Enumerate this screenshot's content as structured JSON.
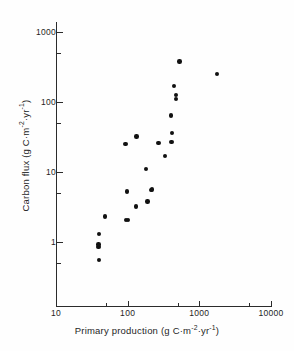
{
  "chart_data": {
    "type": "scatter",
    "title": "",
    "xlabel": "Primary production (g C·m⁻²·yr⁻¹)",
    "ylabel": "Carbon flux (g C·m⁻²·yr⁻¹)",
    "xscale": "log",
    "yscale": "log",
    "xlim": [
      10,
      10000
    ],
    "ylim": [
      0.1,
      1000
    ],
    "grid": false,
    "legend": null,
    "xticks": [
      10,
      100,
      1000,
      10000
    ],
    "xtick_labels": [
      "10",
      "100",
      "1000",
      "10000"
    ],
    "yticks": [
      1,
      10,
      100,
      1000
    ],
    "ytick_labels": [
      "1",
      "10",
      "100",
      "1000"
    ],
    "points": [
      {
        "x": 40,
        "y": 0.55
      },
      {
        "x": 39,
        "y": 0.85
      },
      {
        "x": 39,
        "y": 0.92
      },
      {
        "x": 40,
        "y": 1.3
      },
      {
        "x": 48,
        "y": 2.3
      },
      {
        "x": 95,
        "y": 2.05
      },
      {
        "x": 102,
        "y": 2.05
      },
      {
        "x": 130,
        "y": 3.2
      },
      {
        "x": 190,
        "y": 3.8
      },
      {
        "x": 97,
        "y": 5.3
      },
      {
        "x": 210,
        "y": 5.5
      },
      {
        "x": 218,
        "y": 5.6
      },
      {
        "x": 180,
        "y": 11
      },
      {
        "x": 330,
        "y": 17
      },
      {
        "x": 93,
        "y": 25
      },
      {
        "x": 270,
        "y": 26
      },
      {
        "x": 410,
        "y": 27
      },
      {
        "x": 133,
        "y": 32
      },
      {
        "x": 415,
        "y": 36
      },
      {
        "x": 400,
        "y": 64
      },
      {
        "x": 470,
        "y": 110
      },
      {
        "x": 475,
        "y": 125
      },
      {
        "x": 440,
        "y": 170
      },
      {
        "x": 1750,
        "y": 250
      },
      {
        "x": 530,
        "y": 380
      }
    ]
  },
  "axis_labels": {
    "x_title_prefix": "Primary production (g C·m",
    "x_title_sup1": "-2",
    "x_title_mid": "·yr",
    "x_title_sup2": "-1",
    "x_title_suffix": ")",
    "y_title_prefix": "Carbon flux (g C·m",
    "y_title_sup1": "-2",
    "y_title_mid": "·yr",
    "y_title_sup2": "-1",
    "y_title_suffix": ")"
  },
  "colors": {
    "marker": "#111111",
    "axis": "#2b2b2b",
    "background": "#fefefe",
    "text": "#1f1f1f"
  }
}
